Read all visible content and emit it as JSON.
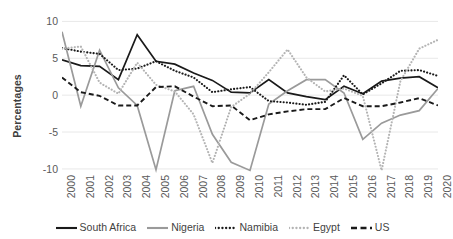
{
  "chart_data": {
    "type": "line",
    "title": "",
    "xlabel": "",
    "ylabel": "Percentages",
    "ylim": [
      -11.5,
      11
    ],
    "yticks": [
      10,
      5,
      0,
      -5,
      -10
    ],
    "grid": true,
    "legend_position": "bottom",
    "categories": [
      "2000",
      "2001",
      "2002",
      "2003",
      "2004",
      "2005",
      "2006",
      "2007",
      "2008",
      "2009",
      "2010",
      "2011",
      "2012",
      "2013",
      "2014",
      "2015",
      "2016",
      "2017",
      "2018",
      "2019",
      "2020"
    ],
    "series": [
      {
        "name": "South Africa",
        "style": "solid",
        "color": "#1a1a1a",
        "values": [
          4.8,
          4.0,
          3.9,
          2.1,
          8.2,
          4.6,
          4.2,
          3.0,
          2.0,
          0.4,
          0.3,
          2.1,
          0.3,
          -0.2,
          -0.6,
          1.2,
          0.2,
          1.9,
          2.3,
          2.5,
          1.0
        ]
      },
      {
        "name": "Nigeria",
        "style": "solid",
        "color": "#9a9a9a",
        "values": [
          8.6,
          -1.5,
          6.1,
          1.0,
          -1.4,
          -10.1,
          0.6,
          1.2,
          -5.3,
          -9.1,
          -10.2,
          -1.2,
          0.6,
          2.1,
          2.1,
          0.3,
          -6.0,
          -3.8,
          -2.7,
          -2.1,
          0.9
        ]
      },
      {
        "name": "Namibia",
        "style": "dotted",
        "color": "#1a1a1a",
        "values": [
          6.4,
          5.9,
          5.6,
          3.4,
          3.6,
          4.6,
          3.3,
          2.4,
          0.4,
          0.8,
          1.1,
          -0.8,
          -1.0,
          -1.3,
          -0.9,
          2.7,
          0.1,
          1.6,
          3.3,
          3.4,
          2.6
        ]
      },
      {
        "name": "Egypt",
        "style": "dotted",
        "color": "#b4b4b4",
        "values": [
          6.3,
          6.6,
          1.7,
          0.2,
          4.4,
          1.4,
          0.5,
          -2.6,
          -9.2,
          -1.6,
          0.2,
          3.1,
          6.2,
          2.4,
          0.5,
          0.9,
          -0.1,
          -10.2,
          1.9,
          6.3,
          7.5
        ]
      },
      {
        "name": "US",
        "style": "dashed",
        "color": "#1a1a1a",
        "values": [
          2.4,
          0.4,
          -0.1,
          -1.4,
          -1.4,
          1.1,
          1.2,
          -0.2,
          -1.5,
          -1.4,
          -3.4,
          -2.6,
          -2.2,
          -1.9,
          -1.9,
          -0.4,
          -1.5,
          -1.5,
          -1.0,
          -0.4,
          -1.4
        ]
      }
    ]
  },
  "legend": {
    "items": [
      {
        "label": "South Africa"
      },
      {
        "label": "Nigeria"
      },
      {
        "label": "Namibia"
      },
      {
        "label": "Egypt"
      },
      {
        "label": "US"
      }
    ]
  }
}
